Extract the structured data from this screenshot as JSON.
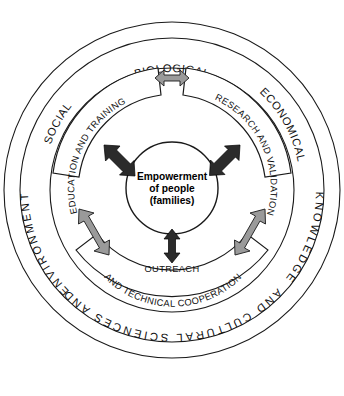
{
  "diagram": {
    "center": {
      "name": "center-node",
      "lines": [
        "Empowerment",
        "of people",
        "(families)"
      ]
    },
    "sectors": [
      {
        "id": "education",
        "label_lines": [
          "EDUCATION AND TRAINING"
        ],
        "position": "left"
      },
      {
        "id": "research",
        "label_lines": [
          "RESEARCH AND VALIDATION"
        ],
        "position": "right"
      },
      {
        "id": "outreach",
        "label_lines": [
          "OUTREACH",
          "AND TECHNICAL COOPERATION"
        ],
        "position": "bottom"
      }
    ],
    "ring_labels": [
      {
        "id": "biological",
        "text": "BIOLOGICAL",
        "position": "top"
      },
      {
        "id": "economical",
        "text": "ECONOMICAL",
        "position": "top-right"
      },
      {
        "id": "social",
        "text": "SOCIAL",
        "position": "top-left"
      },
      {
        "id": "knowledge",
        "text": "KNOWLEDGE",
        "position": "right"
      },
      {
        "id": "environmental",
        "text": "ENVIRONMENTAL",
        "position": "left"
      },
      {
        "id": "outer-bottom",
        "text": "AND CULTURAL SCIENCES AND",
        "position": "bottom"
      }
    ],
    "arrows": [
      {
        "id": "arrow-top-gray",
        "style": "gray",
        "direction": "double",
        "between": "education-research"
      },
      {
        "id": "arrow-left-dark",
        "style": "dark",
        "direction": "double",
        "between": "education-center"
      },
      {
        "id": "arrow-right-dark",
        "style": "dark",
        "direction": "double",
        "between": "research-center"
      },
      {
        "id": "arrow-bottom-dark",
        "style": "dark",
        "direction": "double",
        "between": "center-outreach"
      },
      {
        "id": "arrow-lower-left-gray",
        "style": "gray",
        "direction": "double",
        "between": "education-outreach"
      },
      {
        "id": "arrow-lower-right-gray",
        "style": "gray",
        "direction": "double",
        "between": "research-outreach"
      }
    ],
    "colors": {
      "stroke": "#1a1a1a",
      "arrow_dark": "#2b2b2b",
      "arrow_gray": "#9a9a9a",
      "background": "#ffffff"
    }
  }
}
